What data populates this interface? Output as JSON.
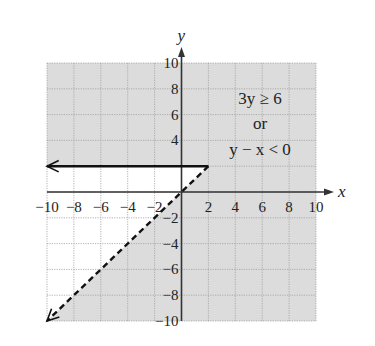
{
  "chart_data": {
    "type": "line",
    "title": "",
    "xlabel": "x",
    "ylabel": "y",
    "xlim": [
      -10,
      10
    ],
    "ylim": [
      -10,
      10
    ],
    "grid": true,
    "grid_step": 2,
    "x_ticks": [
      -10,
      -8,
      -6,
      -4,
      -2,
      2,
      4,
      6,
      8,
      10
    ],
    "y_ticks": [
      10,
      8,
      6,
      4,
      -2,
      -4,
      -6,
      -8,
      -10
    ],
    "x_tick_labels": [
      "−10",
      "−8",
      "−6",
      "−4",
      "−2",
      "2",
      "4",
      "6",
      "8",
      "10"
    ],
    "y_tick_labels": [
      "10",
      "8",
      "6",
      "4",
      "−2",
      "−4",
      "−6",
      "−8",
      "−10"
    ],
    "annotation": {
      "lines": [
        "3y ≥ 6",
        "or",
        "y − x < 0"
      ],
      "position": [
        6,
        6
      ]
    },
    "series": [
      {
        "name": "3y ≥ 6 boundary (y = 2)",
        "style": "solid",
        "arrow": "left",
        "x": [
          2,
          -10
        ],
        "y": [
          2,
          2
        ]
      },
      {
        "name": "y − x < 0 boundary (y = x)",
        "style": "dashed",
        "arrow": "down-left",
        "x": [
          2,
          -10
        ],
        "y": [
          2,
          -10
        ]
      }
    ],
    "shaded_region": "3y ≥ 6 or y − x < 0 (everything except region where y < 2 and y ≥ x)",
    "colors": {
      "shade": "#dcdcdc",
      "grid": "#a0a0a0",
      "axis": "#333333",
      "line": "#111111",
      "background": "#ffffff"
    }
  }
}
